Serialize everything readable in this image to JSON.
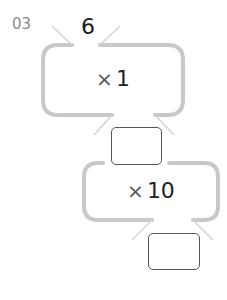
{
  "problem": {
    "number": "03",
    "start_value": "6"
  },
  "steps": [
    {
      "operator": "×",
      "operand": "1",
      "answer": ""
    },
    {
      "operator": "×",
      "operand": "10",
      "answer": ""
    }
  ],
  "colors": {
    "frame_stroke": "#c8c8c8",
    "diagonal_stroke": "#d4d4d4",
    "answer_box_border": "#555555",
    "problem_number": "#8a8a8a",
    "text": "#1a1a1a"
  }
}
